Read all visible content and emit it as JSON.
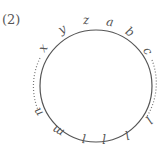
{
  "figure": {
    "label": "(2)",
    "circle": {
      "cx": 96,
      "cy": 86,
      "r": 56,
      "stroke": "#555555"
    },
    "points": [
      {
        "name": "x",
        "x": 43,
        "y": 52,
        "rotate": -55
      },
      {
        "name": "y",
        "x": 62,
        "y": 33,
        "rotate": -30
      },
      {
        "name": "z",
        "x": 86,
        "y": 24,
        "rotate": -5
      },
      {
        "name": "a",
        "x": 110,
        "y": 26,
        "rotate": 10
      },
      {
        "name": "b",
        "x": 130,
        "y": 36,
        "rotate": 35
      },
      {
        "name": "c",
        "x": 148,
        "y": 55,
        "rotate": 60
      },
      {
        "name": "l",
        "x": 149,
        "y": 124,
        "rotate": 135
      },
      {
        "name": "l",
        "x": 127,
        "y": 139,
        "rotate": 160
      },
      {
        "name": "l",
        "x": 104,
        "y": 142,
        "rotate": 180
      },
      {
        "name": "l",
        "x": 84,
        "y": 142,
        "rotate": 185
      },
      {
        "name": "m",
        "x": 58,
        "y": 135,
        "rotate": 210
      },
      {
        "name": "n",
        "x": 38,
        "y": 116,
        "rotate": 235
      }
    ],
    "dotted_arcs": [
      {
        "side": "left",
        "from": "x",
        "to": "n"
      },
      {
        "side": "right",
        "from": "c",
        "to": "l"
      }
    ]
  }
}
